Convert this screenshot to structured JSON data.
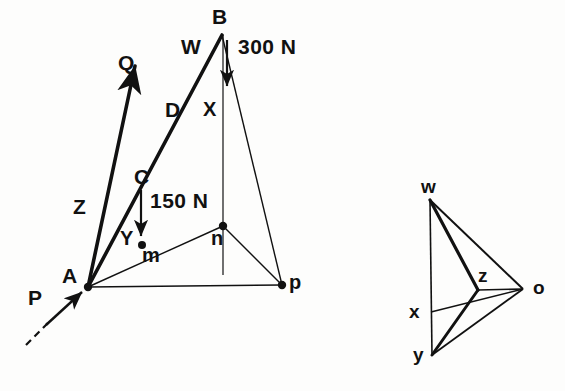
{
  "figure": {
    "stroke_color": "#111111",
    "background": "#fdfdfc"
  },
  "space_diagram": {
    "name": "space-diagram",
    "labels": {
      "B": "B",
      "W": "W",
      "force_300": "300 N",
      "Q": "Q",
      "D": "D",
      "X": "X",
      "C": "C",
      "Z": "Z",
      "force_150": "150 N",
      "Y": "Y",
      "m": "m",
      "n": "n",
      "A": "A",
      "p": "p",
      "P": "P"
    },
    "nodes": {
      "A": [
        88,
        287
      ],
      "B": [
        222,
        33
      ],
      "C": [
        155,
        185
      ],
      "D": [
        194,
        110
      ],
      "Y": [
        142,
        245
      ],
      "n": [
        223,
        226
      ],
      "p": [
        282,
        285
      ],
      "Q_tip": [
        131,
        62
      ],
      "P_tip": [
        62,
        307
      ],
      "P_dash_end": [
        30,
        340
      ],
      "B_vert_bottom": [
        223,
        275
      ],
      "arrow_300_top": [
        227,
        40
      ],
      "arrow_300_bottom": [
        227,
        88
      ],
      "arrow_150_top": [
        141,
        192
      ],
      "arrow_150_bottom": [
        141,
        238
      ]
    }
  },
  "force_polygon": {
    "name": "force-polygon",
    "labels": {
      "w": "w",
      "x": "x",
      "y": "y",
      "z": "z",
      "o": "o"
    },
    "nodes": {
      "w": [
        430,
        200
      ],
      "x": [
        431,
        312
      ],
      "y": [
        432,
        355
      ],
      "z": [
        478,
        290
      ],
      "o": [
        523,
        289
      ]
    }
  }
}
